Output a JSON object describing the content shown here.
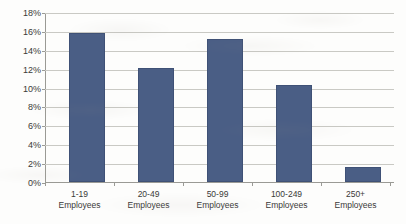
{
  "chart_data": {
    "type": "bar",
    "title": "",
    "subtitle": "",
    "xlabel": "",
    "ylabel": "",
    "categories": [
      "1-19 Employees",
      "20-49 Employees",
      "50-99 Employees",
      "100-249 Employees",
      "250+ Employees"
    ],
    "category_lines": [
      {
        "line1": "1-19",
        "line2": "Employees"
      },
      {
        "line1": "20-49",
        "line2": "Employees"
      },
      {
        "line1": "50-99",
        "line2": "Employees"
      },
      {
        "line1": "100-249",
        "line2": "Employees"
      },
      {
        "line1": "250+",
        "line2": "Employees"
      }
    ],
    "values": [
      16.0,
      12.2,
      15.3,
      10.4,
      1.6
    ],
    "value_labels": [
      "16.0%",
      "12.2%",
      "15.3%",
      "10.4%",
      "1.6%"
    ],
    "ylim": [
      0,
      18
    ],
    "ytick_step": 2,
    "ytick_labels": [
      "18%",
      "16%",
      "14%",
      "12%",
      "10%",
      "8%",
      "6%",
      "4%",
      "2%",
      "0%"
    ],
    "ytick_values": [
      18,
      16,
      14,
      12,
      10,
      8,
      6,
      4,
      2,
      0
    ],
    "grid": true,
    "grid_axis": "y",
    "legend": false,
    "legend_position": "none",
    "series": [
      {
        "name": "Share of establishments",
        "values": [
          16.0,
          12.2,
          15.3,
          10.4,
          1.6
        ]
      }
    ],
    "colors": {
      "bar_fill": "#4a5e85",
      "bar_border": "#3f5176",
      "gridline": "#c9c9c4",
      "axis": "#9a9a95",
      "text": "#3a3a38",
      "background": "#fdfdfc"
    }
  }
}
